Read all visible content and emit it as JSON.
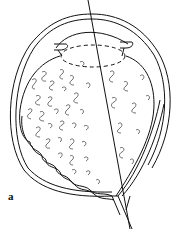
{
  "figure": {
    "panel_label": "a",
    "stroke_color": "#111111",
    "background_color": "#ffffff"
  }
}
